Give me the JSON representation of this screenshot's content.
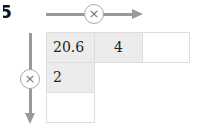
{
  "problem_number": "5",
  "operator_symbol": "×",
  "icons": {
    "horizontal_arrow": "arrow-right-icon",
    "vertical_arrow": "arrow-down-icon"
  },
  "colors": {
    "shaded_cell": "#ececec",
    "arrow": "#999999",
    "border": "#dddddd"
  },
  "grid": {
    "row1": [
      "20.6",
      "4",
      ""
    ],
    "col1": [
      "20.6",
      "2",
      ""
    ]
  }
}
